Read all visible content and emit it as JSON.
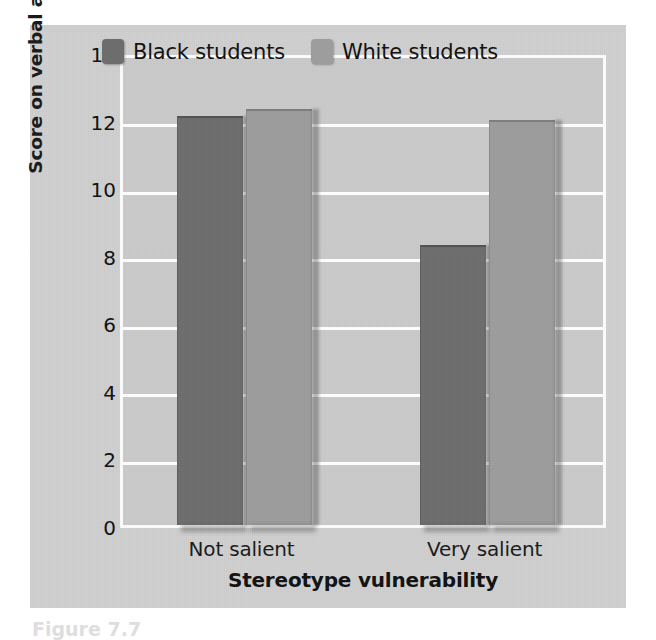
{
  "chart_data": {
    "type": "bar",
    "title": "",
    "subtitle": "",
    "xlabel": "Stereotype vulnerability",
    "ylabel": "Score on verbal ability test",
    "categories": [
      "Not salient",
      "Very salient"
    ],
    "series": [
      {
        "name": "Black students",
        "color": "#6d6d6d",
        "values": [
          12.1,
          8.3
        ]
      },
      {
        "name": "White students",
        "color": "#9d9d9d",
        "values": [
          12.3,
          12.0
        ]
      }
    ],
    "ylim": [
      0,
      14
    ],
    "ytick_values": [
      0,
      2,
      4,
      6,
      8,
      10,
      12,
      14
    ],
    "ytick_labels": [
      "0",
      "2",
      "4",
      "6",
      "8",
      "10",
      "12",
      "14"
    ],
    "grid": true,
    "grid_orientation": "horizontal",
    "grid_color": "#ffffff",
    "legend_position": "top-inside",
    "plot_background": "#cacaca",
    "figure_background": "#cfcfcf"
  },
  "legend": {
    "entries": [
      {
        "label": "Black students",
        "swatch": "dark"
      },
      {
        "label": "White students",
        "swatch": "light"
      }
    ]
  },
  "caption": {
    "fragment": "Figure 7.7"
  }
}
